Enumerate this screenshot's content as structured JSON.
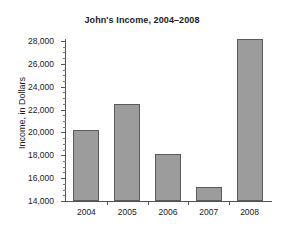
{
  "chart_data": {
    "type": "bar",
    "title": "John's Income, 2004–2008",
    "xlabel": "",
    "ylabel": "Income, in Dollars",
    "categories": [
      "2004",
      "2005",
      "2006",
      "2007",
      "2008"
    ],
    "values": [
      20200,
      22500,
      18100,
      15200,
      28150
    ],
    "ylim": [
      14000,
      28000
    ],
    "ytick_labels": [
      "14,000",
      "16,000",
      "18,000",
      "20,000",
      "22,000",
      "24,000",
      "26,000",
      "28,000"
    ],
    "ytick_values": [
      14000,
      16000,
      18000,
      20000,
      22000,
      24000,
      26000,
      28000
    ],
    "minor_tick_step": 500,
    "grid": false,
    "legend": null,
    "bar_fill_color": "#9c9c9c",
    "bar_edge_color": "#5a5a5a",
    "axis_color": "#555555",
    "text_color": "#1a1a1a",
    "background_color": "#ffffff"
  }
}
